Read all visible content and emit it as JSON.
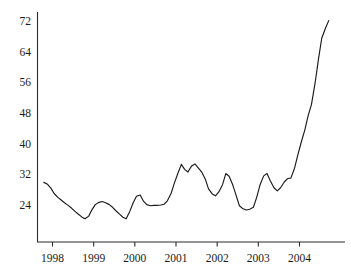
{
  "chart_data": {
    "type": "line",
    "title": "",
    "subtitle": "",
    "xlabel": "",
    "ylabel": "",
    "xlim": [
      1997.75,
      2004.8
    ],
    "ylim": [
      20.3,
      74.0
    ],
    "grid": false,
    "legend": null,
    "y_ticks": [
      24,
      32,
      40,
      48,
      56,
      64,
      72
    ],
    "y_tick_labels": [
      "24",
      "32",
      "40",
      "48",
      "56",
      "64",
      "72"
    ],
    "x_ticks": [
      1998,
      1999,
      2000,
      2001,
      2002,
      2003,
      2004
    ],
    "x_tick_labels": [
      "1998",
      "1999",
      "2000",
      "2001",
      "2002",
      "2003",
      "2004"
    ],
    "line_color": "#1a1a1a",
    "axis_color": "#2b2b2b",
    "series": [
      {
        "name": "series-1",
        "x": [
          1997.79,
          1997.88,
          1997.96,
          1998.04,
          1998.13,
          1998.21,
          1998.29,
          1998.38,
          1998.46,
          1998.54,
          1998.63,
          1998.71,
          1998.79,
          1998.88,
          1998.96,
          1999.04,
          1999.13,
          1999.21,
          1999.29,
          1999.38,
          1999.46,
          1999.54,
          1999.63,
          1999.71,
          1999.79,
          1999.88,
          1999.96,
          2000.04,
          2000.13,
          2000.21,
          2000.29,
          2000.38,
          2000.46,
          2000.54,
          2000.63,
          2000.71,
          2000.79,
          2000.88,
          2000.96,
          2001.04,
          2001.13,
          2001.21,
          2001.29,
          2001.38,
          2001.46,
          2001.54,
          2001.63,
          2001.71,
          2001.79,
          2001.88,
          2001.96,
          2002.04,
          2002.13,
          2002.21,
          2002.29,
          2002.38,
          2002.46,
          2002.54,
          2002.63,
          2002.71,
          2002.79,
          2002.88,
          2002.96,
          2003.04,
          2003.13,
          2003.21,
          2003.29,
          2003.38,
          2003.46,
          2003.54,
          2003.63,
          2003.71,
          2003.79,
          2003.88,
          2003.96,
          2004.04,
          2004.13,
          2004.21,
          2004.29,
          2004.38,
          2004.46,
          2004.54,
          2004.63,
          2004.71
        ],
        "y": [
          29.9,
          29.4,
          28.4,
          27.0,
          26.0,
          25.3,
          24.6,
          23.9,
          23.2,
          22.4,
          21.6,
          20.9,
          20.4,
          21.1,
          22.8,
          24.1,
          24.7,
          24.9,
          24.6,
          24.1,
          23.4,
          22.5,
          21.6,
          20.8,
          20.4,
          22.4,
          24.6,
          26.3,
          26.6,
          25.0,
          24.1,
          23.8,
          23.9,
          23.9,
          24.0,
          24.2,
          25.1,
          27.0,
          29.7,
          32.1,
          34.6,
          33.3,
          32.6,
          34.2,
          34.7,
          33.7,
          32.5,
          30.8,
          28.2,
          26.9,
          26.4,
          27.4,
          29.3,
          32.2,
          31.5,
          29.2,
          26.5,
          23.8,
          23.0,
          22.7,
          22.9,
          23.4,
          26.0,
          29.2,
          31.6,
          32.2,
          30.3,
          28.5,
          27.7,
          28.5,
          30.0,
          30.9,
          31.0,
          33.6,
          37.1,
          40.3,
          43.6,
          47.3,
          50.2,
          55.9,
          62.0,
          67.5,
          70.1,
          72.1
        ]
      }
    ]
  }
}
